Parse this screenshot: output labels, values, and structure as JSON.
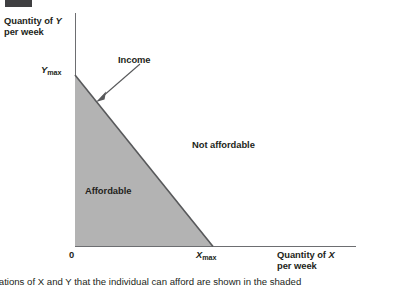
{
  "figure": {
    "badge_color": "#3f3f41",
    "header_cropped_text": "",
    "axes": {
      "y_axis_title_line1_prefix": "Quantity of ",
      "y_axis_title_line1_var": "Y",
      "y_axis_title_line2": "per week",
      "x_axis_title_line1_prefix": "Quantity of ",
      "x_axis_title_line1_var": "X",
      "x_axis_title_line2": "per week",
      "origin_label": "0"
    },
    "intercepts": {
      "y_max_var": "Y",
      "y_max_sub": "max",
      "x_max_var": "X",
      "x_max_sub": "max"
    },
    "annotations": {
      "income_label": "Income",
      "not_affordable_label": "Not affordable",
      "affordable_label": "Affordable"
    },
    "colors": {
      "shaded_region": "#b3b3b3",
      "shaded_region_edge": "#6d6e71",
      "axis": "#6d6e71",
      "text": "#231f20",
      "arrow": "#58595b"
    },
    "caption": {
      "text": "mbinations of X and Y that the individual can afford are shown in the shaded"
    }
  }
}
